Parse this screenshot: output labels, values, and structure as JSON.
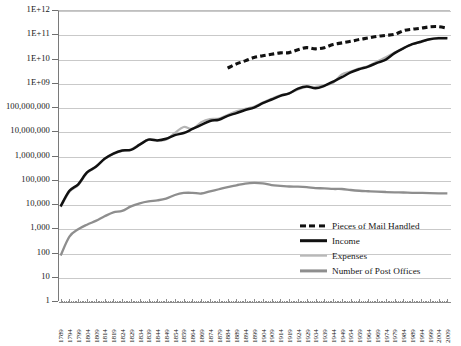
{
  "chart_data": {
    "type": "line",
    "title": "",
    "xlabel": "",
    "ylabel": "",
    "yscale": "log",
    "ylim": [
      1,
      1000000000000
    ],
    "grid": true,
    "legend_position": "bottom-right-inside",
    "ytick_labels": [
      "1E+12",
      "1E+11",
      "1E+10",
      "1E+09",
      "100,000,000",
      "10,000,000",
      "1,000,000",
      "100,000",
      "10,000",
      "1,000",
      "100",
      "10",
      "1"
    ],
    "ytick_values": [
      1000000000000,
      100000000000,
      10000000000,
      1000000000,
      100000000,
      10000000,
      1000000,
      100000,
      10000,
      1000,
      100,
      10,
      1
    ],
    "categories": [
      "1789",
      "1794",
      "1799",
      "1804",
      "1809",
      "1814",
      "1819",
      "1824",
      "1829",
      "1834",
      "1839",
      "1844",
      "1849",
      "1854",
      "1859",
      "1864",
      "1869",
      "1874",
      "1879",
      "1884",
      "1889",
      "1894",
      "1899",
      "1904",
      "1909",
      "1914",
      "1919",
      "1924",
      "1929",
      "1934",
      "1939",
      "1944",
      "1949",
      "1954",
      "1959",
      "1964",
      "1969",
      "1974",
      "1979",
      "1984",
      "1989",
      "1994",
      "1999",
      "2004",
      "2009"
    ],
    "series": [
      {
        "name": "Pieces of Mail Handled",
        "style": "dashed",
        "color": "#111111",
        "x": [
          "1884",
          "1889",
          "1894",
          "1899",
          "1904",
          "1909",
          "1914",
          "1919",
          "1924",
          "1929",
          "1934",
          "1939",
          "1944",
          "1949",
          "1954",
          "1959",
          "1964",
          "1969",
          "1974",
          "1979",
          "1984",
          "1989",
          "1994",
          "1999",
          "2004",
          "2009"
        ],
        "values": [
          4000000000,
          6000000000,
          8000000000,
          11000000000,
          13000000000,
          15000000000,
          17000000000,
          17500000000,
          23000000000,
          28000000000,
          25000000000,
          28000000000,
          38000000000,
          44000000000,
          51000000000,
          61000000000,
          70000000000,
          82000000000,
          90000000000,
          99000000000,
          140000000000,
          161000000000,
          177000000000,
          202000000000,
          206000000000,
          177000000000
        ]
      },
      {
        "name": "Income",
        "style": "solid",
        "color": "#111111",
        "x": [
          "1789",
          "1794",
          "1799",
          "1804",
          "1809",
          "1814",
          "1819",
          "1824",
          "1829",
          "1834",
          "1839",
          "1844",
          "1849",
          "1854",
          "1859",
          "1864",
          "1869",
          "1874",
          "1879",
          "1884",
          "1889",
          "1894",
          "1899",
          "1904",
          "1909",
          "1914",
          "1919",
          "1924",
          "1929",
          "1934",
          "1939",
          "1944",
          "1949",
          "1954",
          "1959",
          "1964",
          "1969",
          "1974",
          "1979",
          "1984",
          "1989",
          "1994",
          "1999",
          "2004",
          "2009"
        ],
        "values": [
          8000,
          35000,
          65000,
          200000,
          340000,
          730000,
          1200000,
          1600000,
          1700000,
          2800000,
          4500000,
          4200000,
          4900000,
          6900000,
          8500000,
          12400000,
          18300000,
          26400000,
          30000000,
          43300000,
          56200000,
          75100000,
          95000000,
          143600000,
          203600000,
          287900000,
          362500000,
          572900000,
          705500000,
          586700000,
          745900000,
          1114500000,
          1690000000,
          2669000000,
          3640000000,
          4625000000,
          6640000000,
          9000000000,
          16700000000,
          26400000000,
          38900000000,
          49300000000,
          62700000000,
          68900000000,
          68100000000
        ]
      },
      {
        "name": "Expenses",
        "style": "solid",
        "color": "#b5b5b5",
        "x": [
          "1789",
          "1794",
          "1799",
          "1804",
          "1809",
          "1814",
          "1819",
          "1824",
          "1829",
          "1834",
          "1839",
          "1844",
          "1849",
          "1854",
          "1859",
          "1864",
          "1869",
          "1874",
          "1879",
          "1884",
          "1889",
          "1894",
          "1899",
          "1904",
          "1909",
          "1914",
          "1919",
          "1924",
          "1929",
          "1934",
          "1939",
          "1944",
          "1949",
          "1954",
          "1959",
          "1964",
          "1969",
          "1974",
          "1979",
          "1984",
          "1989",
          "1994",
          "1999",
          "2004",
          "2009"
        ],
        "values": [
          7500,
          32000,
          60000,
          190000,
          330000,
          720000,
          1150000,
          1550000,
          1780000,
          2900000,
          4600000,
          4300000,
          4500000,
          8500000,
          15000000,
          12600000,
          23700000,
          32100000,
          33400000,
          47200000,
          66300000,
          84300000,
          101600000,
          152800000,
          221000000,
          305000000,
          364000000,
          532000000,
          681000000,
          672000000,
          780000000,
          1000000000,
          2200000000,
          2900000000,
          3900000000,
          4900000000,
          7500000000,
          11300000000,
          17600000000,
          26700000000,
          38500000000,
          47400000000,
          62000000000,
          71000000000,
          71000000000
        ]
      },
      {
        "name": "Number of Post Offices",
        "style": "solid",
        "color": "#8e8e8e",
        "x": [
          "1789",
          "1794",
          "1799",
          "1804",
          "1809",
          "1814",
          "1819",
          "1824",
          "1829",
          "1834",
          "1839",
          "1844",
          "1849",
          "1854",
          "1859",
          "1864",
          "1869",
          "1874",
          "1879",
          "1884",
          "1889",
          "1894",
          "1899",
          "1904",
          "1909",
          "1914",
          "1919",
          "1924",
          "1929",
          "1934",
          "1939",
          "1944",
          "1949",
          "1954",
          "1959",
          "1964",
          "1969",
          "1974",
          "1979",
          "1984",
          "1989",
          "1994",
          "1999",
          "2004",
          "2009"
        ],
        "values": [
          75,
          450,
          903,
          1405,
          2012,
          3100,
          4500,
          5182,
          8004,
          10693,
          12780,
          14103,
          16747,
          23548,
          28539,
          28878,
          27106,
          33244,
          40588,
          50017,
          58999,
          69805,
          75000,
          71131,
          60144,
          56380,
          52641,
          51871,
          49482,
          45000,
          44327,
          41751,
          41464,
          37820,
          35238,
          33624,
          32244,
          31180,
          30326,
          29796,
          28959,
          28672,
          27952,
          27505,
          27232
        ]
      }
    ]
  },
  "legend": {
    "items": [
      {
        "label": "Pieces of Mail Handled"
      },
      {
        "label": "Income"
      },
      {
        "label": "Expenses"
      },
      {
        "label": "Number of Post Offices"
      }
    ]
  }
}
